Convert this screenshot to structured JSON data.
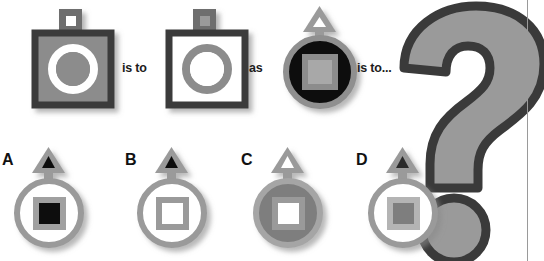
{
  "puzzle": {
    "type": "visual-analogy-multiple-choice",
    "width": 544,
    "height": 261,
    "background": "#ffffff"
  },
  "connectors": {
    "is_to": "is to",
    "as": "as",
    "is_to_ellipsis": "is to..."
  },
  "prompt_figures": [
    {
      "id": "figure-1",
      "outer_shape": "square",
      "outer_fill": "#8c8c8c",
      "outer_border": "#3a3a3a",
      "inner_shape": "ring",
      "inner_ring_color": "#ffffff",
      "inner_center_fill": "#8c8c8c",
      "antenna_shape": "square",
      "antenna_fill": "#6e6e6e",
      "antenna_inner_fill": "#ffffff"
    },
    {
      "id": "figure-2",
      "outer_shape": "square",
      "outer_fill": "#ffffff",
      "outer_border": "#3a3a3a",
      "inner_shape": "ring",
      "inner_ring_color": "#8c8c8c",
      "inner_center_fill": "#ffffff",
      "antenna_shape": "square",
      "antenna_fill": "#6e6e6e",
      "antenna_inner_fill": "#9a9a9a"
    },
    {
      "id": "figure-3",
      "outer_shape": "circle",
      "outer_fill": "#0d0d0d",
      "outer_border": "#8f8f8f",
      "inner_shape": "square",
      "inner_ring_color": "#8c8c8c",
      "inner_center_fill": "#a8a8a8",
      "antenna_shape": "triangle",
      "antenna_fill": "#9a9a9a",
      "antenna_inner_fill": "#ffffff"
    }
  ],
  "options": [
    {
      "letter": "A",
      "outer_shape": "circle",
      "outer_fill": "#ffffff",
      "outer_border": "#9a9a9a",
      "inner_shape": "square",
      "inner_ring_color": "#a0a0a0",
      "inner_center_fill": "#111111",
      "antenna_shape": "triangle",
      "antenna_fill": "#9a9a9a",
      "antenna_inner_fill": "#111111"
    },
    {
      "letter": "B",
      "outer_shape": "circle",
      "outer_fill": "#ffffff",
      "outer_border": "#9a9a9a",
      "inner_shape": "square",
      "inner_ring_color": "#9a9a9a",
      "inner_center_fill": "#ffffff",
      "antenna_shape": "triangle",
      "antenna_fill": "#9a9a9a",
      "antenna_inner_fill": "#111111"
    },
    {
      "letter": "C",
      "outer_shape": "circle",
      "outer_fill": "#7e7e7e",
      "outer_border": "#a5a5a5",
      "inner_shape": "square",
      "inner_ring_color": "#9a9a9a",
      "inner_center_fill": "#ffffff",
      "antenna_shape": "triangle",
      "antenna_fill": "#9a9a9a",
      "antenna_inner_fill": "#ffffff"
    },
    {
      "letter": "D",
      "outer_shape": "circle",
      "outer_fill": "#ffffff",
      "outer_border": "#9a9a9a",
      "inner_shape": "square",
      "inner_ring_color": "#b4b4b4",
      "inner_center_fill": "#7e7e7e",
      "antenna_shape": "triangle",
      "antenna_fill": "#9a9a9a",
      "antenna_inner_fill": "#2b2b2b"
    }
  ],
  "question_mark": {
    "glyph": "?",
    "fill": "#9a9a9a",
    "outline": "#3a3a3a"
  },
  "colors": {
    "text": "#1c1c1c",
    "mid_gray": "#8c8c8c",
    "dark_gray": "#3a3a3a",
    "light_gray": "#b4b4b4",
    "black": "#0d0d0d",
    "white": "#ffffff",
    "divider": "#9a9a9a"
  }
}
